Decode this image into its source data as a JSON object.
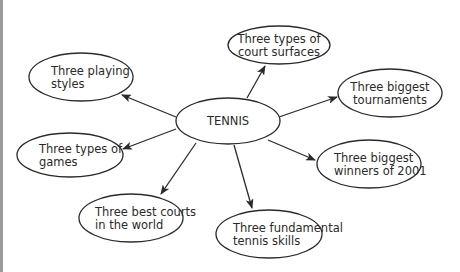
{
  "diagram": {
    "type": "mind-map",
    "center": {
      "label": "TENNIS",
      "cx": 228,
      "cy": 121,
      "rx": 52,
      "ry": 23
    },
    "nodes": [
      {
        "id": "court-surfaces",
        "lines": [
          "Three types of",
          "court surfaces"
        ],
        "cx": 279,
        "cy": 45,
        "rx": 51,
        "ry": 19,
        "align": "middle"
      },
      {
        "id": "playing-styles",
        "lines": [
          "Three playing",
          "styles"
        ],
        "cx": 81,
        "cy": 77,
        "rx": 52,
        "ry": 24,
        "align": "start",
        "tx": 51
      },
      {
        "id": "biggest-tournaments",
        "lines": [
          "Three biggest",
          "tournaments"
        ],
        "cx": 390,
        "cy": 93,
        "rx": 52,
        "ry": 24,
        "align": "middle"
      },
      {
        "id": "types-of-games",
        "lines": [
          "Three types of",
          "games"
        ],
        "cx": 70,
        "cy": 155,
        "rx": 53,
        "ry": 22,
        "align": "start",
        "tx": 39
      },
      {
        "id": "biggest-winners",
        "lines": [
          "Three biggest",
          "winners of 2001"
        ],
        "cx": 369,
        "cy": 164,
        "rx": 52,
        "ry": 24,
        "align": "start",
        "tx": 334
      },
      {
        "id": "best-courts",
        "lines": [
          "Three best courts",
          "in the world"
        ],
        "cx": 131,
        "cy": 218,
        "rx": 52,
        "ry": 24,
        "align": "start",
        "tx": 95
      },
      {
        "id": "fundamental-skills",
        "lines": [
          "Three fundamental",
          "tennis skills"
        ],
        "cx": 269,
        "cy": 234,
        "rx": 53,
        "ry": 24,
        "align": "start",
        "tx": 233
      }
    ],
    "edges": [
      {
        "to": "court-surfaces",
        "x1": 247,
        "y1": 98,
        "x2": 265,
        "y2": 66
      },
      {
        "to": "playing-styles",
        "x1": 176,
        "y1": 117,
        "x2": 122,
        "y2": 95
      },
      {
        "to": "biggest-tournaments",
        "x1": 279,
        "y1": 117,
        "x2": 337,
        "y2": 97
      },
      {
        "to": "types-of-games",
        "x1": 176,
        "y1": 129,
        "x2": 123,
        "y2": 149
      },
      {
        "to": "biggest-winners",
        "x1": 268,
        "y1": 140,
        "x2": 315,
        "y2": 160
      },
      {
        "to": "best-courts",
        "x1": 196,
        "y1": 143,
        "x2": 161,
        "y2": 194
      },
      {
        "to": "fundamental-skills",
        "x1": 234,
        "y1": 145,
        "x2": 252,
        "y2": 208
      }
    ],
    "colors": {
      "stroke": "#2a2a2a",
      "text": "#2a2a2a",
      "background": "#ffffff",
      "left_rule": "#9a9a9a"
    }
  }
}
